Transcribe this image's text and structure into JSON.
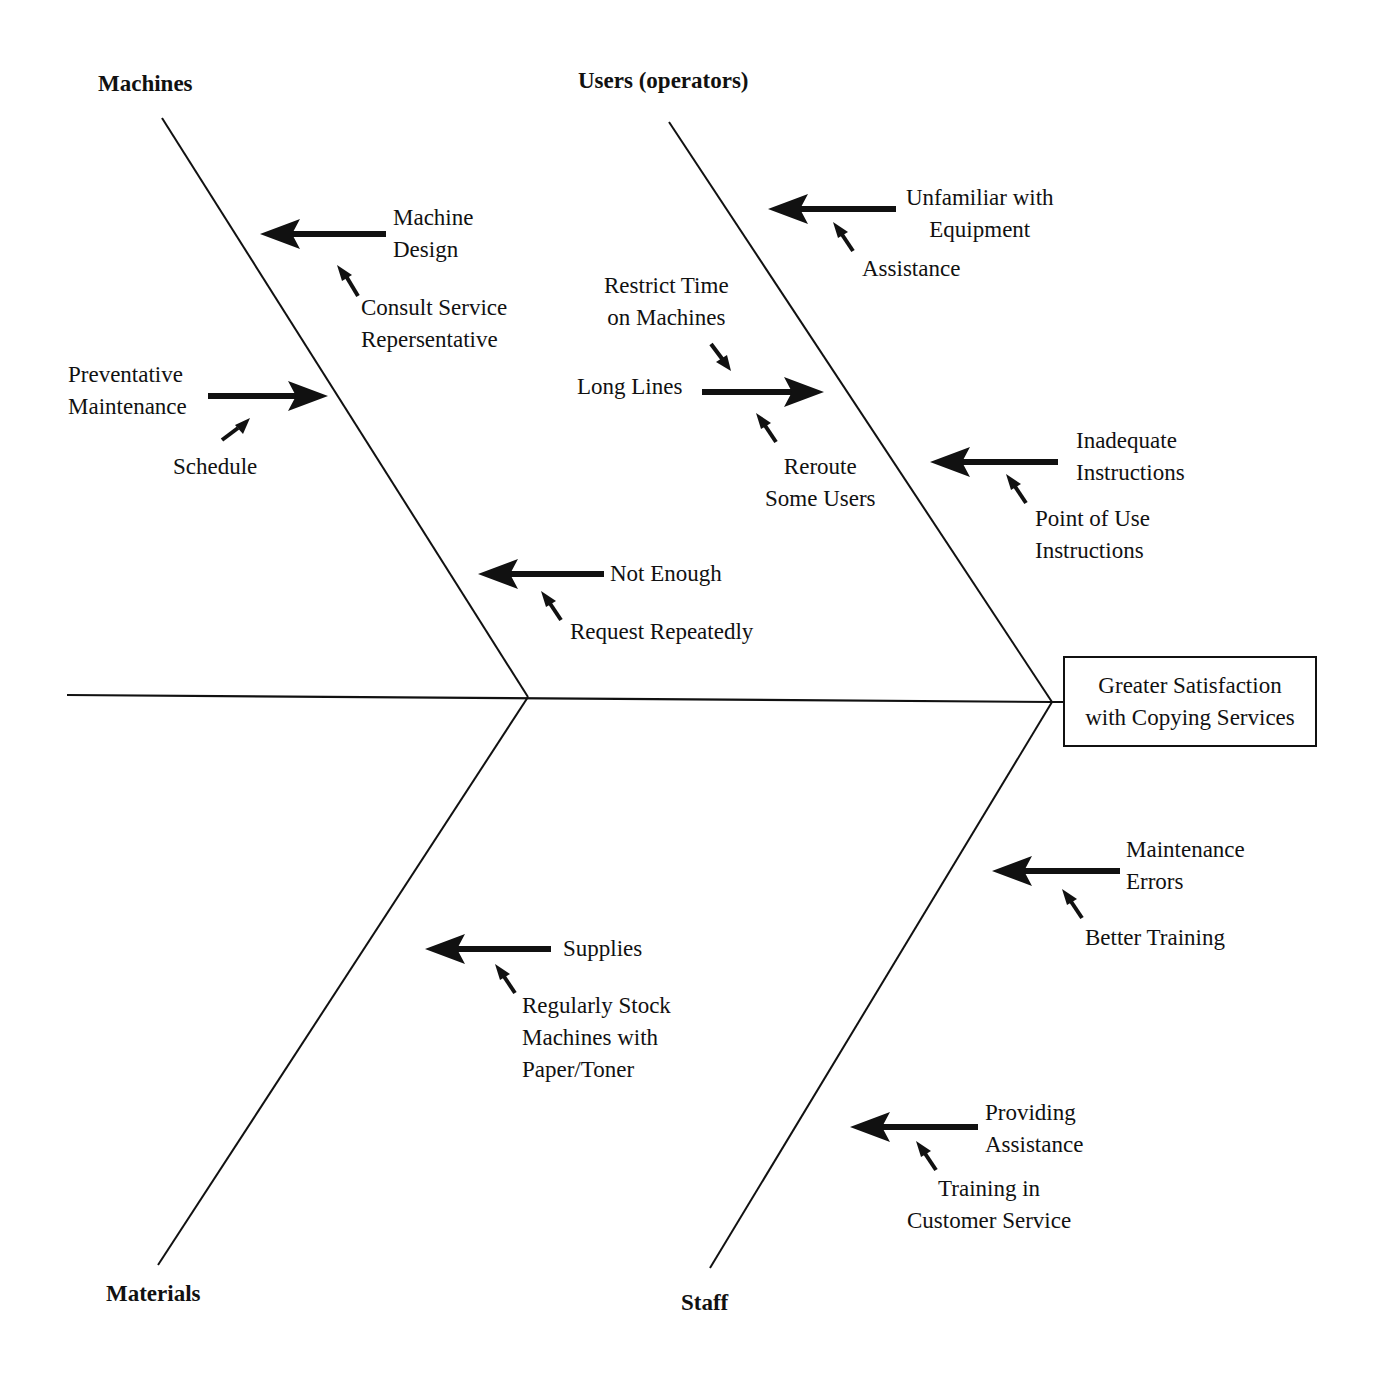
{
  "effect": {
    "line1": "Greater Satisfaction",
    "line2": "with Copying Services"
  },
  "categories": {
    "machines": "Machines",
    "users": "Users (operators)",
    "materials": "Materials",
    "staff": "Staff"
  },
  "causes": {
    "machine_design": {
      "line1": "Machine",
      "line2": "Design",
      "solution_line1": "Consult Service",
      "solution_line2": "Repersentative"
    },
    "preventative_maintenance": {
      "line1": "Preventative",
      "line2": "Maintenance",
      "solution": "Schedule"
    },
    "not_enough": {
      "label": "Not Enough",
      "solution": "Request Repeatedly"
    },
    "unfamiliar": {
      "line1": "Unfamiliar with",
      "line2": "Equipment",
      "solution": "Assistance"
    },
    "long_lines": {
      "label": "Long Lines",
      "solution_a_line1": "Restrict Time",
      "solution_a_line2": "on Machines",
      "solution_b_line1": "Reroute",
      "solution_b_line2": "Some Users"
    },
    "inadequate_instructions": {
      "line1": "Inadequate",
      "line2": "Instructions",
      "solution_line1": "Point of Use",
      "solution_line2": "Instructions"
    },
    "supplies": {
      "label": "Supplies",
      "solution_line1": "Regularly Stock",
      "solution_line2": "Machines with",
      "solution_line3": "Paper/Toner"
    },
    "maintenance_errors": {
      "line1": "Maintenance",
      "line2": "Errors",
      "solution": "Better Training"
    },
    "providing_assistance": {
      "line1": "Providing",
      "line2": "Assistance",
      "solution_line1": "Training in",
      "solution_line2": "Customer Service"
    }
  },
  "colors": {
    "ink": "#111111",
    "background": "#ffffff"
  }
}
